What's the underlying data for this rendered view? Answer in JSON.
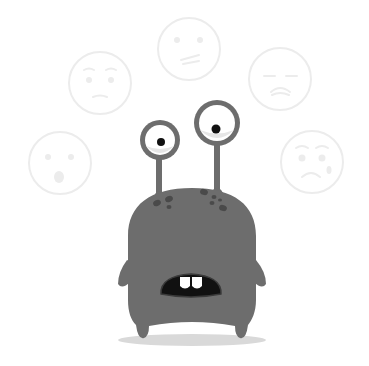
{
  "illustration": {
    "subject": "gray monster with two eyestalks looking surprised",
    "background_color": "#ffffff",
    "monster_color": "#6d6d6d",
    "spot_color": "#4a4a4a",
    "mouth_color": "#111111",
    "tooth_color": "#ffffff",
    "eye_white": "#ffffff",
    "pupil_color": "#111111",
    "shadow_color": "#d9d9d9",
    "face_outline_color": "#ececec"
  },
  "faces": [
    {
      "name": "surprised-face",
      "cx": 60,
      "cy": 163,
      "r": 31
    },
    {
      "name": "worried-face",
      "cx": 100,
      "cy": 83,
      "r": 31
    },
    {
      "name": "confused-face",
      "cx": 189,
      "cy": 49,
      "r": 31
    },
    {
      "name": "sad-face",
      "cx": 280,
      "cy": 79,
      "r": 31
    },
    {
      "name": "crying-face",
      "cx": 312,
      "cy": 162,
      "r": 31
    }
  ]
}
